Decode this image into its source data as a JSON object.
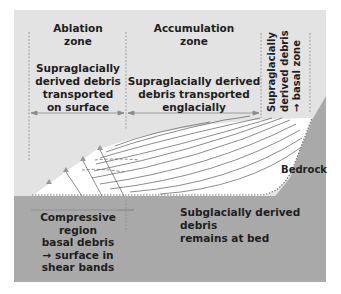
{
  "zones": {
    "ablation": {
      "title": "Ablation\nzone",
      "description": "Supraglacially\nderived debris\ntransported\non surface"
    },
    "accumulation": {
      "title": "Accumulation\nzone",
      "description": "Supraglacially derived\ndebris transported\nenglacially"
    },
    "headwall": {
      "description": "Supraglacially\nderived debris\n→ basal zone"
    }
  },
  "bed_labels": {
    "compressive": "Compressive\nregion\nbasal debris\n→ surface in\nshear bands",
    "subglacial": "Subglacially derived debris\nremains at bed",
    "bedrock": "Bedrock"
  },
  "colors": {
    "sky": "#e3e3e3",
    "bedrock": "#a9a9a9",
    "ice": "#ffffff",
    "flowline": "#5a5a5a",
    "divider": "#8a8a8a",
    "text": "#1e1e1e"
  }
}
